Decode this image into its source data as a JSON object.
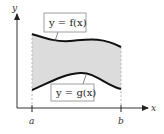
{
  "diagram": {
    "type": "area-between-curves",
    "labels": {
      "y_axis": "y",
      "x_axis": "x",
      "left_bound": "a",
      "right_bound": "b",
      "upper_curve": "y = f(x)",
      "lower_curve": "y = g(x)"
    },
    "colors": {
      "region_fill": "#dcdcdc",
      "curve": "#111111",
      "axis": "#333333",
      "dashed_bounds": "#aaaaaa",
      "label_box_border": "#888888"
    }
  }
}
